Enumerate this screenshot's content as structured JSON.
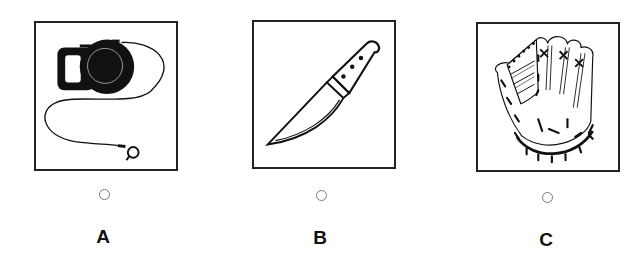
{
  "question": {
    "options": [
      {
        "letter": "A",
        "image": "retractable-dog-leash",
        "selected": false
      },
      {
        "letter": "B",
        "image": "kitchen-knife",
        "selected": false
      },
      {
        "letter": "C",
        "image": "baseball-glove",
        "selected": false
      }
    ]
  },
  "colors": {
    "stroke": "#222222",
    "background": "#ffffff",
    "radio_border": "#777777"
  }
}
